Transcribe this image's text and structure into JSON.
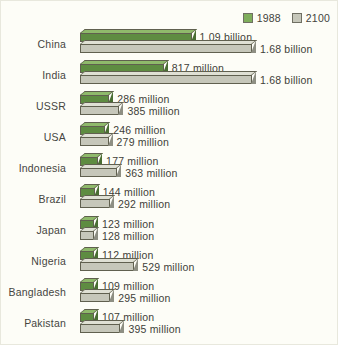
{
  "legend": {
    "items": [
      {
        "label": "1988",
        "swatch": "green-swatch-icon",
        "color": "#7fae5c"
      },
      {
        "label": "2100",
        "swatch": "gray-swatch-icon",
        "color": "#c6c7ba"
      }
    ]
  },
  "chart_data": {
    "type": "bar",
    "orientation": "horizontal",
    "title": "",
    "subtitle": "",
    "xlabel": "",
    "ylabel": "",
    "grid": false,
    "legend_position": "top-right",
    "unit": "people",
    "xlim": [
      0,
      1680
    ],
    "categories": [
      "China",
      "India",
      "USSR",
      "USA",
      "Indonesia",
      "Brazil",
      "Japan",
      "Nigeria",
      "Bangladesh",
      "Pakistan"
    ],
    "series": [
      {
        "name": "1988",
        "color": "#5e8c41",
        "values": [
          1090,
          817,
          286,
          246,
          177,
          144,
          123,
          112,
          109,
          107
        ],
        "labels": [
          "1.09 billion",
          "817 million",
          "286 million",
          "246 million",
          "177 million",
          "144 million",
          "123 million",
          "112 million",
          "109 million",
          "107 million"
        ]
      },
      {
        "name": "2100",
        "color": "#c6c7ba",
        "values": [
          1680,
          1680,
          385,
          279,
          363,
          292,
          128,
          529,
          295,
          395
        ],
        "labels": [
          "1.68 billion",
          "1.68 billion",
          "385 million",
          "279 million",
          "363 million",
          "292 million",
          "128 million",
          "529 million",
          "295 million",
          "395 million"
        ]
      }
    ]
  }
}
